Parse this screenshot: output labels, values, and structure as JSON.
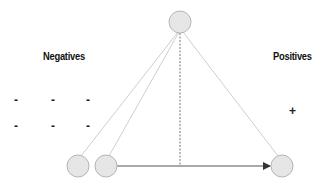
{
  "labels": {
    "negatives": "Negatives",
    "positives": "Positives"
  },
  "signs": {
    "minus": "-",
    "plus": "+"
  },
  "colors": {
    "node_fill": "#e6e6e6",
    "node_stroke": "#b5b5b5",
    "edge": "#c8c8c8",
    "arrow": "#555555",
    "dashed": "#777777",
    "text": "#111111"
  },
  "nodes": [
    {
      "id": "top",
      "cx": 180,
      "cy": 22
    },
    {
      "id": "bottom-left-1",
      "cx": 78,
      "cy": 166
    },
    {
      "id": "bottom-left-2",
      "cx": 106,
      "cy": 166
    },
    {
      "id": "bottom-right",
      "cx": 282,
      "cy": 166
    }
  ]
}
